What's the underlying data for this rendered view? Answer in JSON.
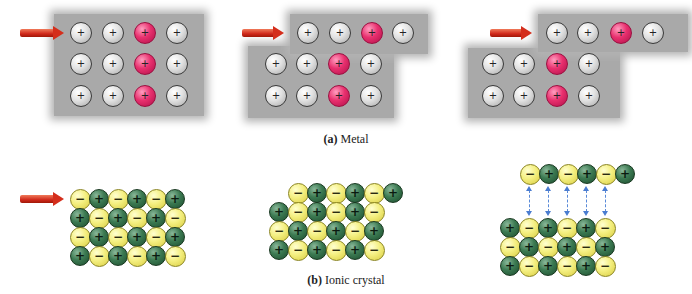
{
  "figure": {
    "metal": {
      "caption_label": "(a)",
      "caption_text": " Metal",
      "ion_symbol": "+",
      "colors": {
        "normal_ion": "#d8d8d8",
        "highlight_ion": "#e8306e",
        "electron_sea": "#a9a9a9",
        "arrow": "#d42e1c"
      },
      "panels": [
        {
          "id": "metal-1",
          "description": "unstressed metal lattice, 3 rows x 4 ions, third column highlighted"
        },
        {
          "id": "metal-2",
          "description": "top row shifted right by one position"
        },
        {
          "id": "metal-3",
          "description": "top row shifted further, electron sea still binds layers"
        }
      ]
    },
    "ionic": {
      "caption_label": "(b)",
      "caption_text": " Ionic crystal",
      "positive_symbol": "+",
      "negative_symbol": "−",
      "colors": {
        "cation": "#3c7a52",
        "anion": "#f4ef80",
        "repulsion_arrows": "#4a7cd0",
        "arrow": "#d42e1c"
      },
      "panels": [
        {
          "id": "ionic-1",
          "rows": [
            [
              "-",
              "+",
              "-",
              "+",
              "-",
              "+"
            ],
            [
              "+",
              "-",
              "+",
              "-",
              "+",
              "-"
            ],
            [
              "-",
              "+",
              "-",
              "+",
              "-",
              "+"
            ],
            [
              "+",
              "-",
              "+",
              "-",
              "+",
              "-"
            ]
          ]
        },
        {
          "id": "ionic-2",
          "rows": [
            [
              "-",
              "+",
              "-",
              "+",
              "-",
              "+"
            ],
            [
              "+",
              "-",
              "+",
              "-",
              "+",
              "-"
            ],
            [
              "-",
              "+",
              "-",
              "+",
              "-",
              "+"
            ],
            [
              "+",
              "-",
              "+",
              "-",
              "+",
              "-"
            ]
          ]
        },
        {
          "id": "ionic-3",
          "rows": [
            [
              "-",
              "+",
              "-",
              "+",
              "-",
              "+"
            ],
            [
              "+",
              "-",
              "+",
              "-",
              "+",
              "-"
            ],
            [
              "-",
              "+",
              "-",
              "+",
              "-",
              "+"
            ],
            [
              "+",
              "-",
              "+",
              "-",
              "+",
              "-"
            ]
          ],
          "repulsion_pairs": 5
        }
      ]
    }
  }
}
